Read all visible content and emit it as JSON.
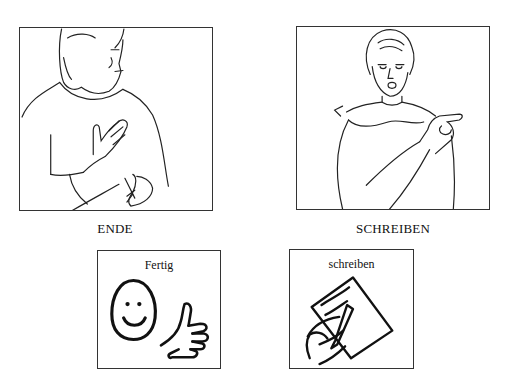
{
  "signs": [
    {
      "id": "ende",
      "caption": "ENDE",
      "illustration": "woman-signing-ende"
    },
    {
      "id": "schreiben",
      "caption": "SCHREIBEN",
      "illustration": "man-signing-schreiben"
    }
  ],
  "symbol_cards": [
    {
      "id": "fertig",
      "label": "Fertig",
      "icons": [
        "smiley-face-icon",
        "thumbs-up-icon"
      ]
    },
    {
      "id": "schreiben",
      "label": "schreiben",
      "icons": [
        "hand-writing-on-paper-icon"
      ]
    }
  ]
}
